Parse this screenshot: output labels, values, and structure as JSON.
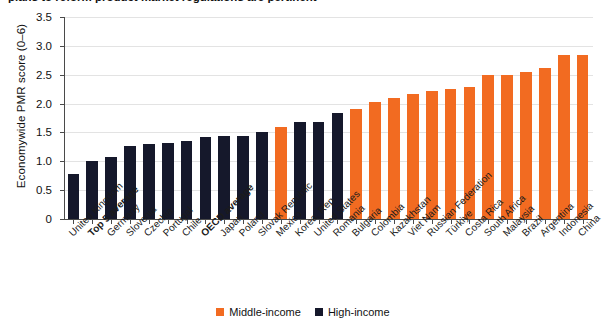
{
  "figure": {
    "title_clipped": "plans to reform product market regulations are pertinent",
    "ylabel": "Economywide PMR score (0–6)"
  },
  "legend": {
    "position": "bottom-center",
    "items": [
      {
        "label": "Middle-income",
        "color": "#F26B21"
      },
      {
        "label": "High-income",
        "color": "#15182B"
      }
    ]
  },
  "chart_data": {
    "type": "bar",
    "title": "plans to reform product market regulations are pertinent",
    "xlabel": "",
    "ylabel": "Economywide PMR score (0–6)",
    "ylim": [
      0,
      3.5
    ],
    "yticks": [
      "0",
      "0.5",
      "1.0",
      "1.5",
      "2.0",
      "2.5",
      "3.0",
      "3.5"
    ],
    "ytick_values": [
      0,
      0.5,
      1.0,
      1.5,
      2.0,
      2.5,
      3.0,
      3.5
    ],
    "grid": true,
    "categories": [
      "United Kingdom",
      "Top 5 average",
      "Germany",
      "Slovenia",
      "Czechia",
      "Portugal",
      "Chile",
      "OECD average",
      "Japan",
      "Poland",
      "Slovak Republic",
      "Mexico",
      "Korea, Rep.",
      "United States",
      "Romania",
      "Bulgaria",
      "Colombia",
      "Kazakhstan",
      "Viet Nam",
      "Russian Federation",
      "Türkiye",
      "Costa Rica",
      "South Africa",
      "Malaysia",
      "Brazil",
      "Argentina",
      "Indonesia",
      "China"
    ],
    "bold_categories": [
      "Top 5 average",
      "OECD average"
    ],
    "values": [
      0.78,
      1.0,
      1.08,
      1.27,
      1.3,
      1.31,
      1.36,
      1.42,
      1.43,
      1.44,
      1.51,
      1.6,
      1.68,
      1.68,
      1.84,
      1.9,
      2.02,
      2.1,
      2.17,
      2.21,
      2.25,
      2.28,
      2.49,
      2.5,
      2.54,
      2.61,
      2.84,
      2.85
    ],
    "groups": [
      "high",
      "high",
      "high",
      "high",
      "high",
      "high",
      "high",
      "high",
      "high",
      "high",
      "high",
      "middle",
      "high",
      "high",
      "high",
      "middle",
      "middle",
      "middle",
      "middle",
      "middle",
      "middle",
      "middle",
      "middle",
      "middle",
      "middle",
      "middle",
      "middle",
      "middle"
    ],
    "colors": {
      "middle": "#F26B21",
      "high": "#15182B"
    }
  }
}
